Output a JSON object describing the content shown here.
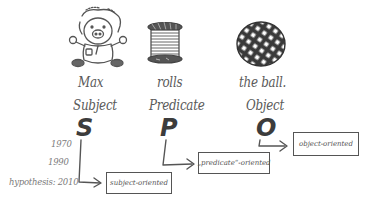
{
  "diagram": {
    "columns": [
      {
        "word": "Max",
        "role": "Subject",
        "letter": "S",
        "icon": "teddy-bear-icon"
      },
      {
        "word": "rolls",
        "role": "Predicate",
        "letter": "P",
        "icon": "spool-of-thread-icon"
      },
      {
        "word": "the ball.",
        "role": "Object",
        "letter": "O",
        "icon": "ball-icon"
      }
    ],
    "timeline": [
      {
        "label": "1970"
      },
      {
        "label": "1990"
      },
      {
        "label": "hypothesis: 2010"
      }
    ],
    "boxes": [
      {
        "label": "subject-oriented"
      },
      {
        "label": "„predicate“-oriented"
      },
      {
        "label": "object-oriented"
      }
    ],
    "colors": {
      "ink": "#555555",
      "dark_ink": "#3c3c3c",
      "background": "#ffffff"
    }
  }
}
